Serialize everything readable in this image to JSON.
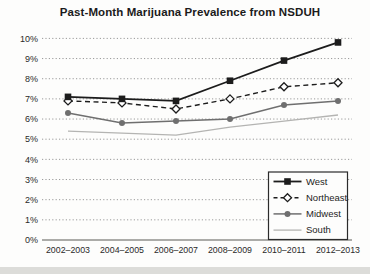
{
  "title": "Past-Month Marijuana Prevalence from NSDUH",
  "chart_data": {
    "type": "line",
    "title": "Past-Month Marijuana Prevalence from NSDUH",
    "categories": [
      "2002–2003",
      "2004–2005",
      "2006–2007",
      "2008–2009",
      "2010–2011",
      "2012–2013"
    ],
    "series": [
      {
        "name": "West",
        "values": [
          7.1,
          7.0,
          6.9,
          7.9,
          8.9,
          9.8
        ],
        "color": "#1c1c1c",
        "marker": "square",
        "dash": "solid",
        "width": 1.8
      },
      {
        "name": "Northeast",
        "values": [
          6.9,
          6.8,
          6.5,
          7.0,
          7.6,
          7.8
        ],
        "color": "#1c1c1c",
        "marker": "diamond-open",
        "dash": "dashed",
        "width": 1.4
      },
      {
        "name": "Midwest",
        "values": [
          6.3,
          5.8,
          5.9,
          6.0,
          6.7,
          6.9
        ],
        "color": "#6f6f6f",
        "marker": "circle",
        "dash": "solid",
        "width": 1.5
      },
      {
        "name": "South",
        "values": [
          5.4,
          5.3,
          5.2,
          5.6,
          5.9,
          6.2
        ],
        "color": "#b4b4b2",
        "marker": "none",
        "dash": "solid",
        "width": 1.3
      }
    ],
    "xlabel": "",
    "ylabel": "",
    "ylim": [
      0,
      10
    ],
    "ytick_step": 1,
    "yticks": [
      "0%",
      "1%",
      "2%",
      "3%",
      "4%",
      "5%",
      "6%",
      "7%",
      "8%",
      "9%",
      "10%"
    ],
    "grid": "horizontal-dotted",
    "legend_position": "lower right",
    "legend_entries": [
      "West",
      "Northeast",
      "Midwest",
      "South"
    ]
  },
  "colors": {
    "grid": "#9a9a9a",
    "axis": "#8f8f8d",
    "tick_text": "#2a2a2a",
    "legend_border": "#2b2b2b",
    "legend_bg": "#fdfdfc",
    "paper": "#fdfdfc",
    "scan_band": "#dcdcd9"
  }
}
